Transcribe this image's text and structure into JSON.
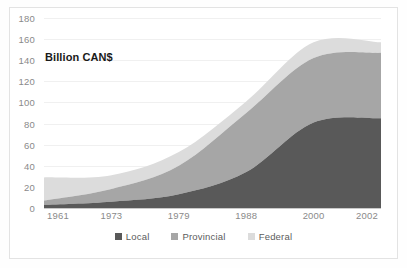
{
  "chart_data": {
    "type": "area",
    "title": "Billion CAN$",
    "subtitle": "",
    "xlabel": "",
    "ylabel": "",
    "stacked": true,
    "grid": true,
    "legend_position": "bottom",
    "ylim": [
      0,
      180
    ],
    "ytick_step": 20,
    "yticks": [
      180,
      160,
      140,
      120,
      100,
      80,
      60,
      40,
      20,
      0
    ],
    "categories": [
      "1961",
      "1973",
      "1979",
      "1988",
      "2000",
      "2002"
    ],
    "series": [
      {
        "name": "Local",
        "color": "#595959",
        "values": [
          3,
          6,
          13,
          34,
          81,
          85
        ]
      },
      {
        "name": "Provincial",
        "color": "#a6a6a6",
        "values": [
          4,
          12,
          27,
          56,
          61,
          62
        ]
      },
      {
        "name": "Federal",
        "color": "#dcdcdc",
        "values": [
          22,
          13,
          13,
          11,
          15,
          10
        ]
      }
    ],
    "stack_tops": {
      "Local": [
        3,
        6,
        13,
        34,
        81,
        85
      ],
      "Provincial": [
        7,
        18,
        40,
        90,
        142,
        147
      ],
      "Federal": [
        29,
        31,
        53,
        101,
        157,
        157
      ]
    }
  },
  "legend": {
    "items": [
      {
        "label": "Local",
        "color": "#595959"
      },
      {
        "label": "Provincial",
        "color": "#a6a6a6"
      },
      {
        "label": "Federal",
        "color": "#dcdcdc"
      }
    ]
  }
}
